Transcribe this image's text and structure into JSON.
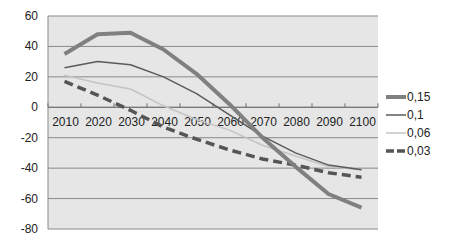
{
  "chart_data": {
    "type": "line",
    "title": "",
    "xlabel": "",
    "ylabel": "",
    "categories": [
      "2010",
      "2020",
      "2030",
      "2040",
      "2050",
      "2060",
      "2070",
      "2080",
      "2090",
      "2100"
    ],
    "ylim": [
      -80,
      60
    ],
    "yticks": [
      "60",
      "40",
      "20",
      "0",
      "-20",
      "-40",
      "-60",
      "-80"
    ],
    "ytick_values": [
      60,
      40,
      20,
      0,
      -20,
      -40,
      -60,
      -80
    ],
    "grid": true,
    "legend_position": "right",
    "plot_background": "#e6e6e6",
    "series": [
      {
        "name": "0,15",
        "color": "#808080",
        "style": "thick",
        "values": [
          35,
          48,
          49,
          38,
          22,
          2,
          -20,
          -39,
          -57,
          -66
        ]
      },
      {
        "name": "0,1",
        "color": "#5a5a5a",
        "style": "thin",
        "values": [
          26,
          30,
          28,
          20,
          9,
          -5,
          -19,
          -30,
          -38,
          -41
        ]
      },
      {
        "name": "0,06",
        "color": "#c4c4c4",
        "style": "thin",
        "values": [
          21,
          16,
          12,
          1,
          -8,
          -15,
          -25,
          -32,
          -39,
          -41
        ]
      },
      {
        "name": "0,03",
        "color": "#555555",
        "style": "dashed",
        "values": [
          17,
          8,
          -2,
          -13,
          -21,
          -28,
          -34,
          -38,
          -43,
          -46
        ]
      }
    ]
  }
}
